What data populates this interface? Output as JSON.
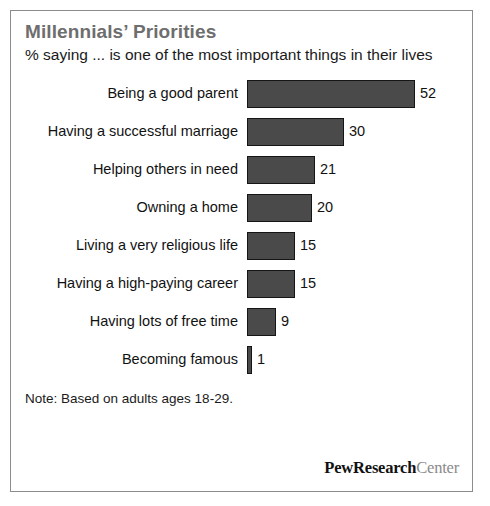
{
  "chart_data": {
    "type": "bar",
    "orientation": "horizontal",
    "title": "Millennials’ Priorities",
    "subtitle": "% saying ... is one of the most important things in their lives",
    "xlabel": "",
    "ylabel": "",
    "xlim": [
      0,
      52
    ],
    "grid": false,
    "legend": "none",
    "note": "Note: Based on adults ages 18-29.",
    "source_logo": {
      "bold_part": "PewResearch",
      "light_part": "Center"
    },
    "categories": [
      "Being a good parent",
      "Having a successful marriage",
      "Helping others in need",
      "Owning a home",
      "Living a very religious life",
      "Having a high-paying career",
      "Having lots of free time",
      "Becoming famous"
    ],
    "values": [
      52,
      30,
      21,
      20,
      15,
      15,
      9,
      1
    ],
    "value_labels": [
      "52",
      "30",
      "21",
      "20",
      "15",
      "15",
      "9",
      "1"
    ],
    "bars": [
      {
        "label": "Being a good parent",
        "value": 52,
        "value_label": "52"
      },
      {
        "label": "Having a successful marriage",
        "value": 30,
        "value_label": "30"
      },
      {
        "label": "Helping others in need",
        "value": 21,
        "value_label": "21"
      },
      {
        "label": "Owning a home",
        "value": 20,
        "value_label": "20"
      },
      {
        "label": "Living a very religious life",
        "value": 15,
        "value_label": "15"
      },
      {
        "label": "Having a high-paying career",
        "value": 15,
        "value_label": "15"
      },
      {
        "label": "Having lots of free time",
        "value": 9,
        "value_label": "9"
      },
      {
        "label": "Becoming famous",
        "value": 1,
        "value_label": "1"
      }
    ],
    "colors": {
      "bar_fill": "#4a4a4a",
      "bar_border": "#151515",
      "title": "#6e6e6e",
      "text": "#111111",
      "background": "#ffffff",
      "frame_border": "#8c8c8c",
      "logo_light": "#8a8a8a"
    }
  }
}
